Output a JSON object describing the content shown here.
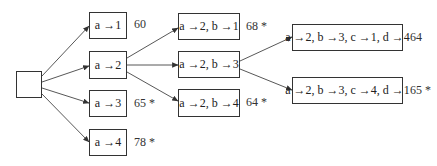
{
  "diagram": {
    "type": "search-tree",
    "root": {
      "label": ""
    },
    "level1": [
      {
        "label": "a →1",
        "value": "60"
      },
      {
        "label": "a →2",
        "value": ""
      },
      {
        "label": "a →3",
        "value": "65 *"
      },
      {
        "label": "a →4",
        "value": "78 *"
      }
    ],
    "level2": [
      {
        "label": "a →2, b →1",
        "value": "68 *"
      },
      {
        "label": "a →2, b →3",
        "value": ""
      },
      {
        "label": "a →2, b →4",
        "value": "64 *"
      }
    ],
    "level3": [
      {
        "label": "a →2, b →3, c →1, d →4",
        "value": "64"
      },
      {
        "label": "a →2, b →3, c →4, d →1",
        "value": "65 *"
      }
    ],
    "edges": [
      [
        "root",
        "a →1"
      ],
      [
        "root",
        "a →2"
      ],
      [
        "root",
        "a →3"
      ],
      [
        "root",
        "a →4"
      ],
      [
        "a →2",
        "a →2, b →1"
      ],
      [
        "a →2",
        "a →2, b →3"
      ],
      [
        "a →2",
        "a →2, b →4"
      ],
      [
        "a →2, b →3",
        "a →2, b →3, c →1, d →4"
      ],
      [
        "a →2, b →3",
        "a →2, b →3, c →4, d →1"
      ]
    ]
  }
}
